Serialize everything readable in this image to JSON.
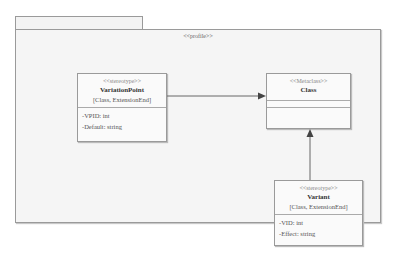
{
  "package": {
    "label": "<<profile>>"
  },
  "classes": {
    "variation_point": {
      "stereotype": "<<stereotype>>",
      "name": "VariationPoint",
      "extends": "[Class, ExtensionEnd]",
      "attributes": [
        "-VPID: int",
        "-Default: string"
      ]
    },
    "metaclass": {
      "stereotype": "<<Metaclass>>",
      "name": "Class"
    },
    "variant": {
      "stereotype": "<<stereotype>>",
      "name": "Variant",
      "extends": "[Class, ExtensionEnd]",
      "attributes": [
        "-VID: int",
        "-Effect: string"
      ]
    }
  },
  "relations": [
    {
      "from": "VariationPoint",
      "to": "Class",
      "type": "extension"
    },
    {
      "from": "Variant",
      "to": "Class",
      "type": "extension"
    }
  ],
  "colors": {
    "line": "#666666",
    "package_fill": "#f5f5f5",
    "class_fill": "#fafafa"
  }
}
